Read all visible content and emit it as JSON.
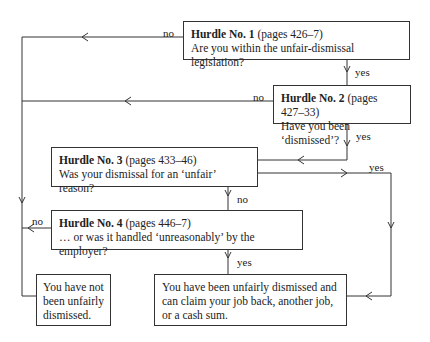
{
  "diagram": {
    "hurdles": [
      {
        "title": "Hurdle No. 1",
        "pages": "(pages 426–7)",
        "question": "Are you within the unfair-dismissal legislation?"
      },
      {
        "title": "Hurdle No. 2",
        "pages": "(pages 427–33)",
        "question": "Have you been ‘dismissed’?"
      },
      {
        "title": "Hurdle No. 3",
        "pages": "(pages 433–46)",
        "question": "Was your dismissal for an ‘unfair’ reason?"
      },
      {
        "title": "Hurdle No. 4",
        "pages": "(pages 446–7)",
        "question": "… or was it handled ‘unreasonably’ by the employer?"
      }
    ],
    "outcomes": {
      "not_dismissed": "You have not been unfairly dismissed.",
      "dismissed": "You have been unfairly dismissed and can claim your job back, another job, or a cash sum."
    },
    "edge_labels": {
      "h1_no": "no",
      "h1_yes": "yes",
      "h2_no": "no",
      "h2_yes": "yes",
      "h3_yes": "yes",
      "h3_no": "no",
      "h4_no": "no",
      "h4_yes": "yes"
    },
    "line_color": "#333333"
  }
}
